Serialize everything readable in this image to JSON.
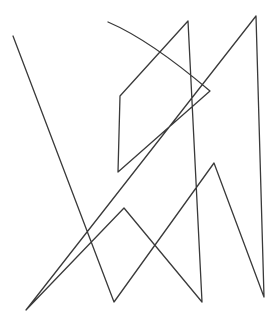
{
  "drawing": {
    "description": "Hand-drawn single continuous line sketch",
    "stroke_color": "#3a3a3a",
    "background": "#ffffff",
    "stroke_width": 1.3,
    "points": [
      [
        13,
        36
      ],
      [
        114,
        302
      ],
      [
        214,
        163
      ],
      [
        264,
        297
      ],
      [
        256,
        16
      ],
      [
        26,
        310
      ],
      [
        124,
        208
      ],
      [
        202,
        302
      ],
      [
        188,
        21
      ],
      [
        120,
        96
      ],
      [
        118,
        172
      ],
      [
        210,
        91
      ],
      [
        108,
        22
      ]
    ]
  }
}
